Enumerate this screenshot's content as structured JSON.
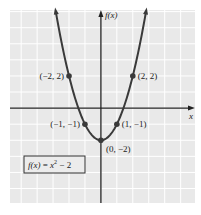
{
  "chart_data": {
    "type": "line",
    "title": "",
    "function_label": "f(x) = x² − 2",
    "function_parts": {
      "fx": "f(x)",
      "eq": " = ",
      "x": "x",
      "exp": "2",
      "rest": " − 2"
    },
    "xlabel": "x",
    "ylabel": "f(x)",
    "xlim": [
      -5.7,
      5.9
    ],
    "ylim": [
      -5.9,
      6.1
    ],
    "grid": true,
    "grid_step": 1,
    "curve": {
      "expression": "x^2 - 2",
      "x_range": [
        -2.83,
        2.83
      ]
    },
    "points": [
      {
        "x": -2,
        "y": 2,
        "label": "(−2, 2)",
        "label_side": "left"
      },
      {
        "x": 2,
        "y": 2,
        "label": "(2, 2)",
        "label_side": "right"
      },
      {
        "x": -1,
        "y": -1,
        "label": "(−1, −1)",
        "label_side": "left"
      },
      {
        "x": 1,
        "y": -1,
        "label": "(1, −1)",
        "label_side": "right"
      },
      {
        "x": 0,
        "y": -2,
        "label": "(0, −2)",
        "label_side": "below-right"
      }
    ],
    "colors": {
      "curve": "#3a3a3a",
      "axis": "#222222",
      "grid_bg": "#e9e9e9",
      "grid_line": "#ffffff",
      "point": "#3a3a3a"
    }
  }
}
